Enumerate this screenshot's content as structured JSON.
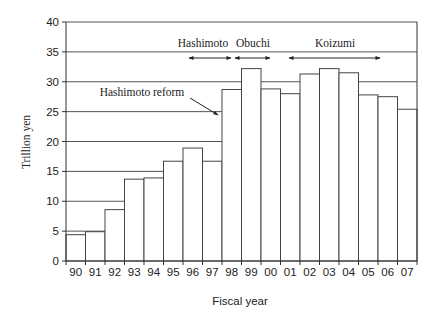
{
  "chart_data": {
    "type": "bar",
    "title": "",
    "xlabel": "Fiscal year",
    "ylabel": "Trillion yen",
    "ylim": [
      0,
      40
    ],
    "yticks": [
      0,
      5,
      10,
      15,
      20,
      25,
      30,
      35,
      40
    ],
    "grid": "horizontal",
    "legend": null,
    "categories": [
      "90",
      "91",
      "92",
      "93",
      "94",
      "95",
      "96",
      "97",
      "98",
      "99",
      "00",
      "01",
      "02",
      "03",
      "04",
      "05",
      "06",
      "07"
    ],
    "values": [
      4.4,
      4.9,
      8.6,
      13.7,
      13.9,
      16.7,
      18.9,
      16.7,
      28.7,
      32.2,
      28.8,
      28.0,
      31.3,
      32.2,
      31.5,
      27.8,
      27.5,
      25.4
    ],
    "annotations": [
      {
        "text": "Hashimoto",
        "type": "span-arrow",
        "from": "96",
        "to": "97"
      },
      {
        "text": "Obuchi",
        "type": "span-arrow",
        "from": "99",
        "to": "99"
      },
      {
        "text": "Koizumi",
        "type": "span-arrow",
        "from": "01",
        "to": "05"
      },
      {
        "text": "Hashimoto reform",
        "type": "pointer-arrow",
        "target": "97/98"
      }
    ]
  },
  "labels": {
    "xlabel": "Fiscal year",
    "ylabel": "Trillion yen",
    "hashimoto": "Hashimoto",
    "obuchi": "Obuchi",
    "koizumi": "Koizumi",
    "hashimoto_reform": "Hashimoto reform"
  }
}
